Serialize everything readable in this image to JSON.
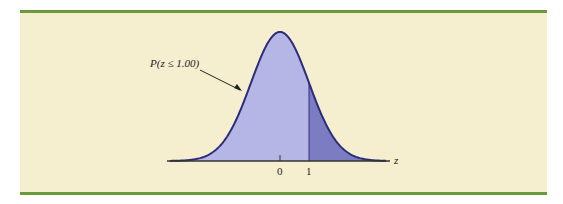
{
  "chart_data": {
    "type": "area",
    "title": "",
    "distribution": "standard normal",
    "shaded_region": {
      "label": "P(z ≤ 1.00)",
      "from": "-inf",
      "to": 1.0
    },
    "upper_tail": {
      "from": 1.0,
      "to": "inf"
    },
    "x_ticks": [
      "0",
      "1"
    ],
    "xlabel": "z",
    "ylabel": "",
    "grid": false
  },
  "labels": {
    "annotation": "P(z ≤ 1.00)",
    "tick_0": "0",
    "tick_1": "1",
    "axis": "z"
  },
  "colors": {
    "background": "#f6efcf",
    "rule": "#6a9a3a",
    "fill_main": "#b6b6e6",
    "fill_tail": "#7c7cc2",
    "curve": "#2c2c7c"
  }
}
